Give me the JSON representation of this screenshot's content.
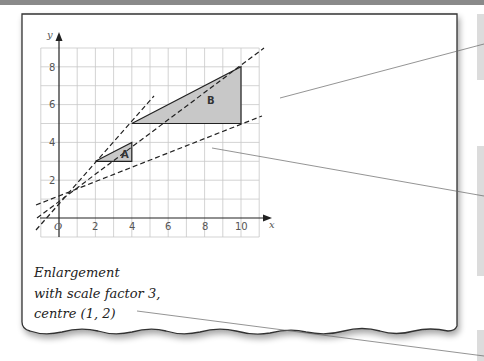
{
  "diagram": {
    "axes": {
      "x_label": "x",
      "y_label": "y",
      "origin_label": "O",
      "x_ticks": [
        "2",
        "4",
        "6",
        "8",
        "10"
      ],
      "y_ticks": [
        "2",
        "4",
        "6",
        "8"
      ],
      "x_range": [
        -1,
        11
      ],
      "y_range": [
        -1,
        9
      ]
    },
    "shapes": [
      {
        "label": "A",
        "vertices": [
          [
            2,
            3
          ],
          [
            4,
            3
          ],
          [
            4,
            4
          ]
        ]
      },
      {
        "label": "B",
        "vertices": [
          [
            4,
            5
          ],
          [
            10,
            5
          ],
          [
            10,
            8
          ]
        ]
      }
    ],
    "centre_of_enlargement": [
      1,
      2
    ],
    "note": {
      "lines": [
        "Enlargement",
        "with scale factor 3,",
        "centre (1, 2)"
      ]
    },
    "colors": {
      "shape_fill": "#c8c8c8",
      "grid": "#c8c8c8",
      "side_box": "#dcdcdc",
      "top_bar": "#8a8a8a"
    }
  }
}
